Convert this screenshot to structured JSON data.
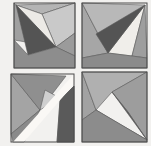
{
  "artwork": {
    "title": "Four folded-paper geometric studies",
    "background_color": "#f2f1ef",
    "outline_color": "#4b4b4b",
    "facet_stroke_color": "#5a5a5a",
    "palette": {
      "dark": "#545454",
      "mid_dark": "#7e7e7e",
      "mid": "#949494",
      "mid_light": "#a9a9a9",
      "light": "#c2c2c2",
      "pale": "#d8d8d8",
      "white": "#f4f3f1"
    },
    "panels": [
      {
        "id": "panel-top-left",
        "label": "Top-left study",
        "bounds": {
          "x": 14,
          "y": 3,
          "w": 61,
          "h": 65
        },
        "facets": [
          {
            "name": "upper-left-wedge",
            "color": "#a0a0a0",
            "points": "14,3 56,47 14,40"
          },
          {
            "name": "dark-spear",
            "color": "#545454",
            "points": "16,5 56,47 28,55"
          },
          {
            "name": "white-blade",
            "color": "#eceae6",
            "points": "16,5 56,47 42,14"
          },
          {
            "name": "pale-upper-right",
            "color": "#c9c9c9",
            "points": "42,14 75,3 75,33 56,47"
          },
          {
            "name": "top-strip",
            "color": "#b4b4b4",
            "points": "16,5 42,14 75,3"
          },
          {
            "name": "right-wedge",
            "color": "#9b9b9b",
            "points": "56,47 75,33 75,56"
          },
          {
            "name": "lower-fan",
            "color": "#8d8d8d",
            "points": "14,40 28,55 56,47 75,56 75,68 14,68"
          }
        ]
      },
      {
        "id": "panel-top-right",
        "label": "Top-right study",
        "bounds": {
          "x": 82,
          "y": 3,
          "w": 65,
          "h": 65
        },
        "facets": [
          {
            "name": "left-field",
            "color": "#a6a6a6",
            "points": "82,3 108,53 82,58"
          },
          {
            "name": "top-left-sliver",
            "color": "#b8b8b8",
            "points": "82,3 145,5 108,53"
          },
          {
            "name": "dark-spear",
            "color": "#545454",
            "points": "145,5 108,53 96,34"
          },
          {
            "name": "white-blade",
            "color": "#f0eeea",
            "points": "145,5 108,53 132,56"
          },
          {
            "name": "right-wedge",
            "color": "#9e9e9e",
            "points": "145,5 132,56 147,58"
          },
          {
            "name": "bottom-band",
            "color": "#8b8b8b",
            "points": "82,58 108,53 132,56 147,58 147,68 82,68"
          }
        ]
      },
      {
        "id": "panel-bottom-left",
        "label": "Bottom-left study with white diagonal fold",
        "bounds": {
          "x": 11,
          "y": 74,
          "w": 63,
          "h": 68
        },
        "facets": [
          {
            "name": "left-field",
            "color": "#a4a4a4",
            "points": "11,74 40,110 11,134"
          },
          {
            "name": "upper-band",
            "color": "#8f8f8f",
            "points": "11,74 66,76 40,110"
          },
          {
            "name": "pale-wedge",
            "color": "#cfcfcf",
            "points": "40,110 45,90 60,98"
          },
          {
            "name": "white-diagonal",
            "color": "#faf8f5",
            "points": "13,142 74,74 74,84 24,142"
          },
          {
            "name": "dark-spear",
            "color": "#5a5a5a",
            "points": "74,86 60,100 57,142 74,142"
          },
          {
            "name": "mid-lower-right",
            "color": "#9a9a9a",
            "points": "60,100 74,86 74,142 57,142"
          },
          {
            "name": "bottom-wedge",
            "color": "#8a8a8a",
            "points": "11,134 40,110 24,142 13,142"
          }
        ]
      },
      {
        "id": "panel-bottom-right",
        "label": "Bottom-right study",
        "bounds": {
          "x": 82,
          "y": 72,
          "w": 65,
          "h": 70
        },
        "facets": [
          {
            "name": "left-field",
            "color": "#a2a2a2",
            "points": "82,72 96,110 82,120"
          },
          {
            "name": "upper-band",
            "color": "#b0b0b0",
            "points": "82,72 147,72 112,92 96,110"
          },
          {
            "name": "dark-spear",
            "color": "#565656",
            "points": "112,92 147,140 128,112"
          },
          {
            "name": "white-blade",
            "color": "#dedcd8",
            "points": "96,110 147,140 112,120"
          },
          {
            "name": "upper-right-field",
            "color": "#9d9d9d",
            "points": "147,72 147,140 128,112 112,92"
          },
          {
            "name": "bottom-band",
            "color": "#8c8c8c",
            "points": "82,120 96,110 147,140 147,142 82,142"
          }
        ]
      }
    ]
  }
}
